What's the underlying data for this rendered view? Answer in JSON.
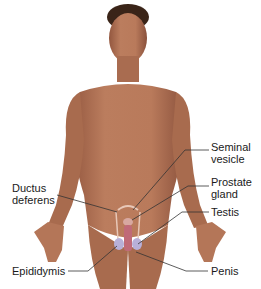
{
  "diagram": {
    "colors": {
      "background": "#ffffff",
      "skin": "#b87a5c",
      "skin_shadow": "#8e5540",
      "hair": "#3a2418",
      "organ_outline": "#e8c8b8",
      "testis": "#b8b0d8",
      "penis": "#c06a78",
      "leader_line": "#333333",
      "label_text": "#1a1a1a"
    },
    "labels": [
      {
        "id": "seminal-vesicle",
        "text": "Seminal\nvesicle"
      },
      {
        "id": "prostate-gland",
        "text": "Prostate\ngland"
      },
      {
        "id": "testis",
        "text": "Testis"
      },
      {
        "id": "ductus-deferens",
        "text": "Ductus\ndeferens"
      },
      {
        "id": "epididymis",
        "text": "Epididymis"
      },
      {
        "id": "penis",
        "text": "Penis"
      }
    ]
  }
}
